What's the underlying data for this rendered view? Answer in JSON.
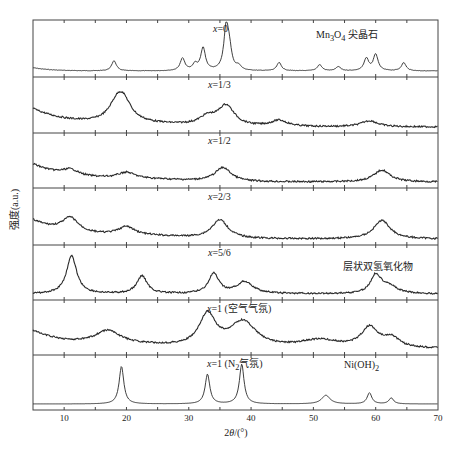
{
  "chart_data": {
    "type": "line",
    "title": "",
    "xlabel": "2θ/(°)",
    "ylabel": "强度(a.u.)",
    "xlim": [
      5,
      70
    ],
    "xticks": [
      10,
      20,
      30,
      40,
      50,
      60,
      70
    ],
    "grid": false,
    "layout": "stacked panels",
    "panels": [
      {
        "label": "x=0",
        "annotation": "Mn3O4 尖晶石",
        "peaks": [
          [
            18,
            0.25
          ],
          [
            29,
            0.3
          ],
          [
            31,
            0.15
          ],
          [
            32.3,
            0.55
          ],
          [
            36,
            1.0
          ],
          [
            36.5,
            0.45
          ],
          [
            38,
            0.1
          ],
          [
            44.5,
            0.2
          ],
          [
            51,
            0.15
          ],
          [
            54,
            0.1
          ],
          [
            58.5,
            0.3
          ],
          [
            60,
            0.4
          ],
          [
            64.5,
            0.2
          ]
        ],
        "baseline": "low"
      },
      {
        "label": "x=1/3",
        "peaks": [
          [
            18.5,
            0.4
          ],
          [
            19.5,
            0.45
          ],
          [
            33,
            0.2
          ],
          [
            36,
            0.5
          ],
          [
            44.5,
            0.15
          ],
          [
            59,
            0.15
          ]
        ],
        "baseline": "decaying"
      },
      {
        "label": "x=1/2",
        "peaks": [
          [
            11,
            0.15
          ],
          [
            20,
            0.15
          ],
          [
            35.5,
            0.35
          ],
          [
            61,
            0.3
          ]
        ],
        "baseline": "decaying"
      },
      {
        "label": "x=2/3",
        "peaks": [
          [
            11,
            0.35
          ],
          [
            20,
            0.2
          ],
          [
            35,
            0.45
          ],
          [
            61,
            0.45
          ]
        ],
        "baseline": "decaying"
      },
      {
        "label": "x=5/6",
        "annotation": "层状双氢氧化物",
        "peaks": [
          [
            11.2,
            0.95
          ],
          [
            22.5,
            0.45
          ],
          [
            34,
            0.5
          ],
          [
            39,
            0.3
          ],
          [
            60,
            0.45
          ],
          [
            62,
            0.2
          ]
        ],
        "baseline": "flat"
      },
      {
        "label": "x=1 (空气气氛)",
        "peaks": [
          [
            17,
            0.35
          ],
          [
            33,
            0.8
          ],
          [
            38.7,
            0.65
          ],
          [
            51,
            0.2
          ],
          [
            59,
            0.5
          ],
          [
            62.5,
            0.25
          ]
        ],
        "baseline": "decaying"
      },
      {
        "label": "x=1 (N2气氛)",
        "annotation": "Ni(OH)2",
        "peaks": [
          [
            19.2,
            0.95
          ],
          [
            33,
            0.75
          ],
          [
            38.5,
            1.0
          ],
          [
            52,
            0.22
          ],
          [
            59,
            0.28
          ],
          [
            62.5,
            0.15
          ]
        ],
        "baseline": "flat"
      }
    ]
  },
  "labels": {
    "panels": [
      {
        "text_html": "<i>x</i>=0"
      },
      {
        "text_html": "<i>x</i>=1/3"
      },
      {
        "text_html": "<i>x</i>=1/2"
      },
      {
        "text_html": "<i>x</i>=2/3"
      },
      {
        "text_html": "<i>x</i>=5/6"
      },
      {
        "text_html": "<i>x</i>=1 (空气气氛)"
      },
      {
        "text_html": "<i>x</i>=1 (N<sub>2</sub>气氛)"
      }
    ],
    "annotations": [
      {
        "panel": 0,
        "text_html": "Mn<sub>3</sub>O<sub>4</sub> 尖晶石"
      },
      {
        "panel": 4,
        "text_html": "层状双氢氧化物"
      },
      {
        "panel": 6,
        "text_html": "Ni(OH)<sub>2</sub>"
      }
    ],
    "xlabel_html": "2<i>θ</i>/(°)",
    "ylabel": "强度(a.u.)"
  },
  "colors": {
    "line": "#2a2a2a",
    "frame": "#444444"
  }
}
